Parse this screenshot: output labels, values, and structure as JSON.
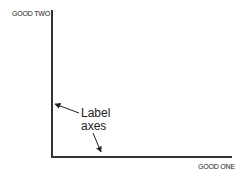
{
  "diagram": {
    "y_axis_label": "GOOD TWO",
    "x_axis_label": "GOOD ONE",
    "annotation": {
      "line1": "Label",
      "line2": "axes"
    },
    "colors": {
      "axis": "#333333",
      "text": "#222222"
    }
  }
}
